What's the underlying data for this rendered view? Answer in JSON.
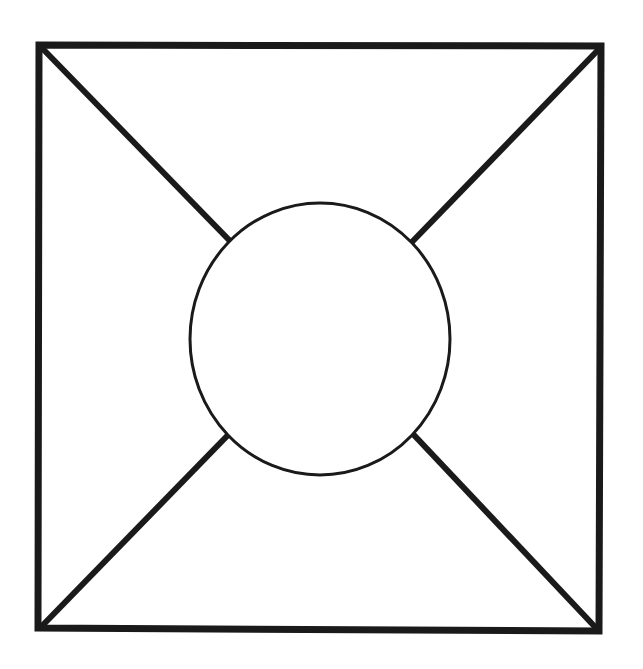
{
  "diagram": {
    "canvas": {
      "width": 643,
      "height": 669,
      "background": "#ffffff"
    },
    "stroke_color": "#1a1a1a",
    "square": {
      "points": [
        [
          39,
          45
        ],
        [
          601,
          46
        ],
        [
          599,
          631
        ],
        [
          38,
          628
        ]
      ],
      "stroke_width": 7
    },
    "circle": {
      "cx": 320,
      "cy": 339,
      "rx": 130,
      "ry": 136,
      "stroke_width": 3,
      "fill": "#ffffff"
    },
    "diagonals": [
      {
        "name": "top-left",
        "x1": 42,
        "y1": 48,
        "x2": 231,
        "y2": 242
      },
      {
        "name": "top-right",
        "x1": 599,
        "y1": 49,
        "x2": 411,
        "y2": 243
      },
      {
        "name": "bottom-left",
        "x1": 41,
        "y1": 627,
        "x2": 229,
        "y2": 434
      },
      {
        "name": "bottom-right",
        "x1": 597,
        "y1": 629,
        "x2": 413,
        "y2": 434
      }
    ],
    "diagonal_stroke_width": 6
  }
}
